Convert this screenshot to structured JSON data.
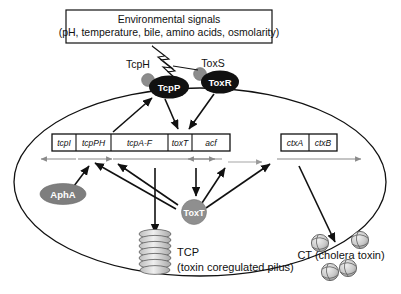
{
  "figure": {
    "signal_box": {
      "line1": "Environmental signals",
      "line2": "(pH, temperature, bile, amino acids, osmolarity)"
    },
    "membrane_proteins": [
      {
        "name": "TcpH",
        "shape": "gray-circle",
        "label_position": "above-left"
      },
      {
        "name": "TcpP",
        "shape": "black-ellipse",
        "label_position": "inside"
      },
      {
        "name": "ToxS",
        "shape": "gray-circle",
        "label_position": "above-right"
      },
      {
        "name": "ToxR",
        "shape": "black-ellipse",
        "label_position": "inside"
      }
    ],
    "regulators": [
      {
        "name": "AphA",
        "shape": "gray-ellipse"
      },
      {
        "name": "ToxT",
        "shape": "gray-circle"
      }
    ],
    "gene_clusters": [
      {
        "name": "tcp-acf-cluster",
        "genes": [
          "tcpI",
          "tcpPH",
          "tcpA-F",
          "toxT",
          "acf"
        ],
        "transcript_arrows": [
          "left",
          "right",
          "right",
          "left",
          "right"
        ]
      },
      {
        "name": "ctx-cluster",
        "genes": [
          "ctxA",
          "ctxB"
        ],
        "transcript_arrows": [
          "right"
        ]
      }
    ],
    "products": [
      {
        "abbrev": "TCP",
        "full_name": "(toxin coregulated pilus)",
        "glyph": "pilus-helix"
      },
      {
        "abbrev": "CT (cholera toxin)",
        "full_name": "",
        "glyph": "toxin-spheres",
        "count": 4
      }
    ],
    "colors": {
      "gray_protein": "#8c8c8c",
      "black_protein": "#111111",
      "transcript_arrow": "#8a8a8a",
      "outline": "#111111",
      "background": "#ffffff"
    }
  }
}
